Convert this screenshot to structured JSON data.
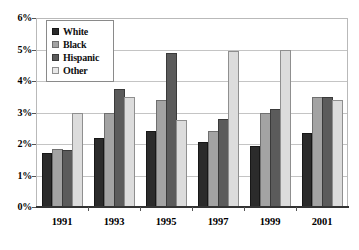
{
  "chart_data": {
    "type": "bar",
    "title": "",
    "subtitle": "",
    "xlabel": "",
    "ylabel": "",
    "categories": [
      "1991",
      "1993",
      "1995",
      "1997",
      "1999",
      "2001"
    ],
    "series": [
      {
        "name": "White",
        "values": [
          1.7,
          2.2,
          2.4,
          2.05,
          1.95,
          2.35
        ],
        "color": "#2b2b2b"
      },
      {
        "name": "Black",
        "values": [
          1.85,
          3.0,
          3.4,
          2.4,
          3.0,
          3.5
        ],
        "color": "#a3a3a3"
      },
      {
        "name": "Hispanic",
        "values": [
          1.8,
          3.75,
          4.9,
          2.8,
          3.1,
          3.5
        ],
        "color": "#5b5b5b"
      },
      {
        "name": "Other",
        "values": [
          3.0,
          3.5,
          2.75,
          4.95,
          5.0,
          3.4
        ],
        "color": "#dcdcdc"
      }
    ],
    "ylim": [
      0,
      6
    ],
    "ytick_values": [
      0,
      1,
      2,
      3,
      4,
      5,
      6
    ],
    "ytick_labels": [
      "0%",
      "1%",
      "2%",
      "3%",
      "4%",
      "5%",
      "6%"
    ],
    "grid": true,
    "legend_position": "upper-left-inside",
    "legend_entries": [
      "White",
      "Black",
      "Hispanic",
      "Other"
    ]
  }
}
